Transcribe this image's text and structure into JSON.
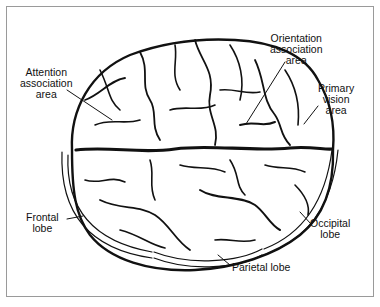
{
  "diagram": {
    "type": "brain-top-view",
    "labels": {
      "attention": [
        "Attention",
        "association",
        "area"
      ],
      "orientation": [
        "Orientation",
        "association",
        "area"
      ],
      "vision": [
        "Primary",
        "vision",
        "area"
      ],
      "frontal": [
        "Frontal",
        "lobe"
      ],
      "occipital": [
        "Occipital",
        "lobe"
      ],
      "parietal": [
        "Parietal lobe"
      ]
    },
    "colors": {
      "ink": "#111111",
      "frame": "#9a9a9a",
      "background": "#ffffff"
    }
  }
}
